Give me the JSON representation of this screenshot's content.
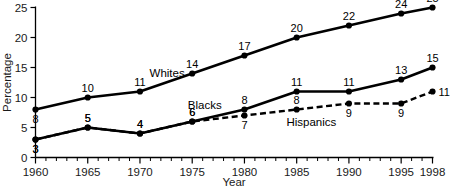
{
  "chart_data": {
    "type": "line",
    "title": "",
    "xlabel": "Year",
    "ylabel": "Percentage",
    "x": [
      1960,
      1965,
      1970,
      1975,
      1980,
      1985,
      1990,
      1995,
      1998
    ],
    "xlim": [
      1960,
      1998
    ],
    "ylim": [
      0,
      25
    ],
    "xticks": [
      1960,
      1965,
      1970,
      1975,
      1980,
      1985,
      1990,
      1995,
      1998
    ],
    "xtick_labels": [
      "1960",
      "1965",
      "1970",
      "1975",
      "1980",
      "1985",
      "1990",
      "1995",
      "1998"
    ],
    "yticks": [
      0,
      5,
      10,
      15,
      20,
      25
    ],
    "ytick_labels": [
      "0",
      "5",
      "10",
      "15",
      "20",
      "25"
    ],
    "minor_xticks_interval": 1,
    "grid": false,
    "legend": "inline-labels",
    "series": [
      {
        "name": "Whites",
        "style": "solid",
        "color": "#000000",
        "values": [
          8,
          10,
          11,
          14,
          17,
          20,
          22,
          24,
          25
        ],
        "point_labels": [
          "8",
          "10",
          "11",
          "14",
          "17",
          "20",
          "22",
          "24",
          "25"
        ],
        "label_positions": [
          "below",
          "above",
          "above",
          "above",
          "above",
          "above",
          "above",
          "above",
          "above"
        ],
        "inline_label": "Whites",
        "inline_label_x": 1972.6,
        "inline_label_y": 13.4
      },
      {
        "name": "Blacks",
        "style": "solid",
        "color": "#000000",
        "values": [
          3,
          5,
          4,
          6,
          8,
          11,
          11,
          13,
          15
        ],
        "point_labels": [
          "3",
          "5",
          "4",
          "6",
          "8",
          "11",
          "11",
          "13",
          "15"
        ],
        "label_positions": [
          "below",
          "above",
          "above",
          "above",
          "above",
          "above",
          "above",
          "above",
          "above"
        ],
        "inline_label": "Blacks",
        "inline_label_x": 1976.2,
        "inline_label_y": 8.1
      },
      {
        "name": "Hispanics",
        "style": "dashed",
        "color": "#000000",
        "values": [
          3,
          5,
          4,
          6,
          7,
          8,
          9,
          9,
          11
        ],
        "point_labels": [
          "3",
          "5",
          "4",
          "6",
          "7",
          "8",
          "9",
          "9",
          "11"
        ],
        "label_positions": [
          "below",
          "above",
          "above",
          "above",
          "below",
          "above",
          "below",
          "below",
          "right"
        ],
        "inline_label": "Hispanics",
        "inline_label_x": 1986.4,
        "inline_label_y": 5.3
      }
    ]
  }
}
